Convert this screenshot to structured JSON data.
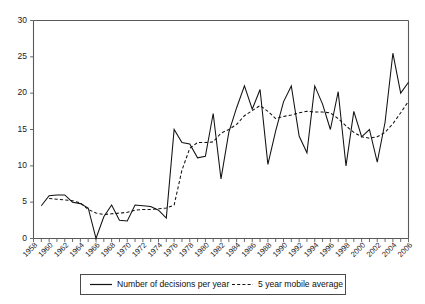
{
  "chart_data": {
    "type": "line",
    "title": "",
    "xlabel": "",
    "ylabel": "",
    "ylim": [
      0,
      30
    ],
    "xlim": [
      1958,
      2006
    ],
    "yticks": [
      0,
      5,
      10,
      15,
      20,
      25,
      30
    ],
    "grid": false,
    "legend_position": "bottom",
    "x_tick_interval_years": 1,
    "x_label_interval_years": 2,
    "x_tick_labels": [
      "1958",
      "1960",
      "1962",
      "1964",
      "1966",
      "1968",
      "1970",
      "1972",
      "1974",
      "1976",
      "1978",
      "1980",
      "1982",
      "1984",
      "1986",
      "1988",
      "1990",
      "1992",
      "1994",
      "1996",
      "1998",
      "2000",
      "2002",
      "2004",
      "2006"
    ],
    "x": [
      1958,
      1959,
      1960,
      1961,
      1962,
      1963,
      1964,
      1965,
      1966,
      1967,
      1968,
      1969,
      1970,
      1971,
      1972,
      1973,
      1974,
      1975,
      1976,
      1977,
      1978,
      1979,
      1980,
      1981,
      1982,
      1983,
      1984,
      1985,
      1986,
      1987,
      1988,
      1989,
      1990,
      1991,
      1992,
      1993,
      1994,
      1995,
      1996,
      1997,
      1998,
      1999,
      2000,
      2001,
      2002,
      2003,
      2004,
      2005,
      2006
    ],
    "series": [
      {
        "name": "Number of decisions per year",
        "style": "solid",
        "color": "#111111",
        "start_year": 1959,
        "values": [
          null,
          4.5,
          5.9,
          6.0,
          6.0,
          5.0,
          4.8,
          4.2,
          0.0,
          3.0,
          4.6,
          2.5,
          2.4,
          4.6,
          4.5,
          4.4,
          3.9,
          2.8,
          15.0,
          13.2,
          13.0,
          11.1,
          11.3,
          17.2,
          8.2,
          14.6,
          18.0,
          21.0,
          17.8,
          20.5,
          10.2,
          14.8,
          18.8,
          21.0,
          14.1,
          11.8,
          21.0,
          18.5,
          15.0,
          20.2,
          10.0,
          17.5,
          14.0,
          15.0,
          10.5,
          16.0,
          25.5,
          20.0,
          21.5
        ]
      },
      {
        "name": "5 year mobile average",
        "style": "dashed",
        "color": "#111111",
        "start_year": 1961,
        "values": [
          null,
          null,
          5.5,
          5.4,
          5.3,
          5.2,
          4.9,
          4.0,
          3.5,
          3.3,
          3.4,
          3.5,
          3.6,
          3.9,
          4.0,
          4.0,
          4.1,
          4.2,
          4.6,
          9.4,
          12.4,
          13.2,
          13.2,
          13.3,
          14.5,
          15.0,
          15.7,
          16.9,
          17.6,
          18.3,
          17.5,
          16.5,
          16.8,
          17.0,
          17.3,
          17.5,
          17.4,
          17.4,
          17.3,
          16.5,
          15.5,
          14.6,
          14.0,
          13.8,
          14.0,
          14.6,
          15.8,
          17.3,
          18.9
        ]
      }
    ]
  },
  "legend": {
    "entries": [
      {
        "label": "Number of decisions per year",
        "style": "solid"
      },
      {
        "label": "5 year mobile average",
        "style": "dashed"
      }
    ]
  }
}
